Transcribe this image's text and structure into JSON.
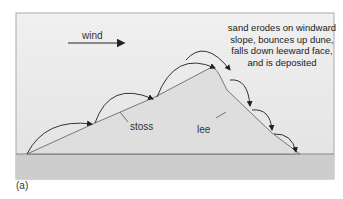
{
  "diagram": {
    "wind_label": "wind",
    "description": "sand erodes on windward slope, bounces up dune, falls down leeward face, and is deposited",
    "description_lines": [
      "sand erodes on windward",
      "slope, bounces up dune,",
      "falls down leeward face,",
      "and is deposited"
    ],
    "stoss_label": "stoss",
    "lee_label": "lee",
    "panel_label": "(a)",
    "colors": {
      "background": "#e6e6e6",
      "ground": "#cfcfcf",
      "dune": "#dcdcdc",
      "line": "#333333"
    }
  }
}
